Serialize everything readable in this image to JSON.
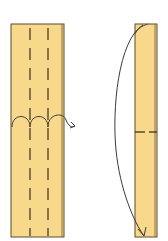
{
  "diagram": {
    "colors": {
      "paper": "#f8d98c",
      "paper_shade": "#eec66a",
      "outline": "#5a4a30",
      "fold_line": "#3c3020",
      "arrow": "#3a3a3a",
      "background": "#ffffff"
    },
    "steps": [
      {
        "label": "step-1-pleat-fold",
        "description": "Paper strip with two vertical valley fold lines (dashed); pleat fold with looping arrow",
        "fold_lines": 2
      },
      {
        "label": "step-2-fold-down",
        "description": "Narrow strip with horizontal dashed fold line; top corner folded down along curved arrow to bottom",
        "fold_lines": 1
      }
    ]
  }
}
